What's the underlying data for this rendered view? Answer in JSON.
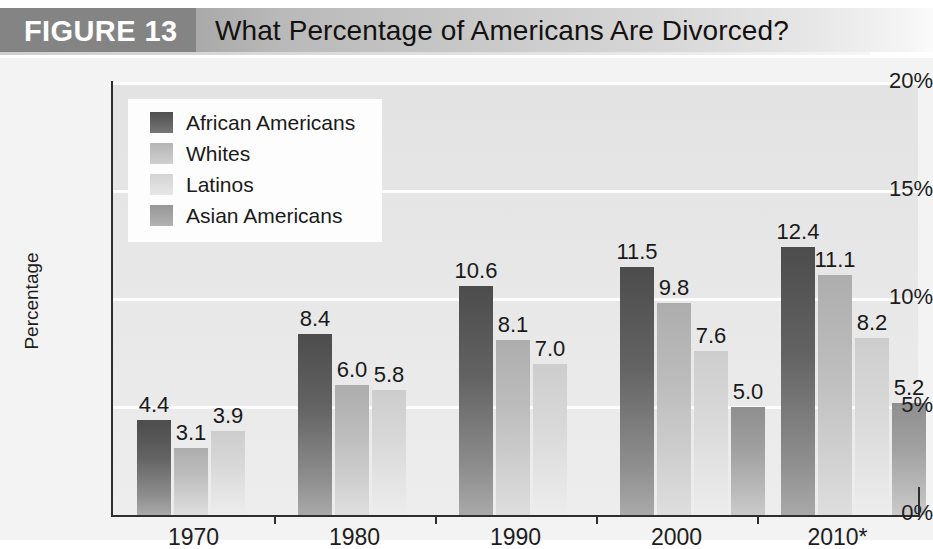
{
  "figure": {
    "tag": "FIGURE 13",
    "title": "What Percentage of Americans Are Divorced?"
  },
  "chart_data": {
    "type": "bar",
    "title": "What Percentage of Americans Are Divorced?",
    "xlabel": "",
    "ylabel": "Percentage",
    "ylim": [
      0,
      20
    ],
    "yticks": [
      "0%",
      "5%",
      "10%",
      "15%",
      "20%"
    ],
    "ytick_values": [
      0,
      5,
      10,
      15,
      20
    ],
    "grid": true,
    "legend_position": "upper-left-inside",
    "categories": [
      "1970",
      "1980",
      "1990",
      "2000",
      "2010*"
    ],
    "series": [
      {
        "name": "African Americans",
        "color": "#636363",
        "values": [
          4.4,
          8.4,
          10.6,
          11.5,
          12.4
        ]
      },
      {
        "name": "Whites",
        "color": "#bdbdbd",
        "values": [
          3.1,
          6.0,
          8.1,
          9.8,
          11.1
        ]
      },
      {
        "name": "Latinos",
        "color": "#d8d8d8",
        "values": [
          3.9,
          5.8,
          7.0,
          7.6,
          8.2
        ]
      },
      {
        "name": "Asian Americans",
        "color": "#a0a0a0",
        "values": [
          null,
          null,
          null,
          5.0,
          5.2
        ]
      }
    ],
    "value_labels": {
      "1970": [
        "4.4",
        "3.1",
        "3.9"
      ],
      "1980": [
        "8.4",
        "6.0",
        "5.8"
      ],
      "1990": [
        "10.6",
        "8.1",
        "7.0"
      ],
      "2000": [
        "11.5",
        "9.8",
        "7.6",
        "5.0"
      ],
      "2010*": [
        "12.4",
        "11.1",
        "8.2",
        "5.2"
      ]
    }
  },
  "colors": {
    "banner_tag_bg": "#848484",
    "plot_bg": "#e8e8e8",
    "gridline": "#fdfdfd",
    "axis": "#2e2e2e",
    "text": "#1a1a1a"
  }
}
